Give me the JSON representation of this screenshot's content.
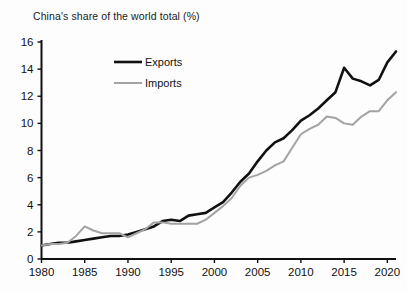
{
  "chart_data": {
    "type": "line",
    "title": "China's share of the world total (%)",
    "xlabel": "",
    "ylabel": "",
    "xlim": [
      1980,
      2021
    ],
    "ylim": [
      0,
      16
    ],
    "ytick_step": 2,
    "yticks": [
      0,
      2,
      4,
      6,
      8,
      10,
      12,
      14,
      16
    ],
    "xticks": [
      1980,
      1985,
      1990,
      1995,
      2000,
      2005,
      2010,
      2015,
      2020
    ],
    "grid": false,
    "legend_position": "upper-left-inside",
    "x": [
      1980,
      1981,
      1982,
      1983,
      1984,
      1985,
      1986,
      1987,
      1988,
      1989,
      1990,
      1991,
      1992,
      1993,
      1994,
      1995,
      1996,
      1997,
      1998,
      1999,
      2000,
      2001,
      2002,
      2003,
      2004,
      2005,
      2006,
      2007,
      2008,
      2009,
      2010,
      2011,
      2012,
      2013,
      2014,
      2015,
      2016,
      2017,
      2018,
      2019,
      2020,
      2021
    ],
    "series": [
      {
        "name": "Exports",
        "color": "#111111",
        "width": 2.6,
        "values": [
          1.0,
          1.1,
          1.2,
          1.2,
          1.3,
          1.4,
          1.5,
          1.6,
          1.7,
          1.7,
          1.8,
          2.0,
          2.2,
          2.4,
          2.8,
          2.9,
          2.8,
          3.2,
          3.3,
          3.4,
          3.8,
          4.2,
          4.9,
          5.7,
          6.3,
          7.2,
          8.0,
          8.6,
          8.9,
          9.5,
          10.2,
          10.6,
          11.1,
          11.7,
          12.3,
          14.1,
          13.3,
          13.1,
          12.8,
          13.2,
          14.5,
          15.3
        ]
      },
      {
        "name": "Imports",
        "color": "#a3a3a3",
        "width": 2.0,
        "values": [
          1.0,
          1.1,
          1.1,
          1.2,
          1.7,
          2.4,
          2.1,
          1.9,
          1.9,
          1.9,
          1.6,
          1.9,
          2.2,
          2.7,
          2.7,
          2.6,
          2.6,
          2.6,
          2.6,
          2.9,
          3.4,
          3.9,
          4.5,
          5.4,
          6.0,
          6.2,
          6.5,
          6.9,
          7.2,
          8.2,
          9.2,
          9.6,
          9.9,
          10.5,
          10.4,
          10.0,
          9.9,
          10.5,
          10.9,
          10.9,
          11.7,
          12.3
        ]
      }
    ],
    "legend": [
      {
        "label": "Exports",
        "color": "#111111",
        "width": 2.6
      },
      {
        "label": "Imports",
        "color": "#a3a3a3",
        "width": 2.0
      }
    ]
  }
}
